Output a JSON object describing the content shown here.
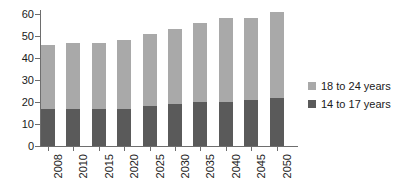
{
  "chart_data": {
    "type": "bar",
    "subtype": "stacked-vertical",
    "title": "",
    "subtitle": "",
    "xlabel": "",
    "ylabel": "",
    "categories": [
      "2008",
      "2010",
      "2015",
      "2020",
      "2025",
      "2030",
      "2035",
      "2040",
      "2045",
      "2050"
    ],
    "series": [
      {
        "name": "14 to 17 years",
        "color": "#5a5a5a",
        "values": [
          17,
          17,
          17,
          17,
          18,
          19,
          20,
          20,
          21,
          22
        ]
      },
      {
        "name": "18 to 24 years",
        "color": "#a9a9a9",
        "values": [
          29,
          30,
          30,
          31,
          33,
          34,
          36,
          38,
          37,
          39
        ]
      }
    ],
    "totals": [
      46,
      47,
      47,
      48,
      51,
      53,
      56,
      58,
      58,
      61
    ],
    "ylim": [
      0,
      60
    ],
    "yticks": [
      "0",
      "10",
      "20",
      "30",
      "40",
      "50",
      "60"
    ],
    "ytick_values": [
      0,
      10,
      20,
      30,
      40,
      50,
      60
    ],
    "grid": false,
    "legend_position": "right"
  },
  "legend": {
    "entries": [
      {
        "label": "18 to 24 years",
        "color": "#a9a9a9",
        "swatch_name": "legend-swatch-18-to-24"
      },
      {
        "label": "14 to 17 years",
        "color": "#5a5a5a",
        "swatch_name": "legend-swatch-14-to-17"
      }
    ]
  },
  "axes": {
    "y_axis_color": "#6e6e6e",
    "x_axis_color": "#6e6e6e",
    "tick_label_color": "#1a1a1a"
  }
}
